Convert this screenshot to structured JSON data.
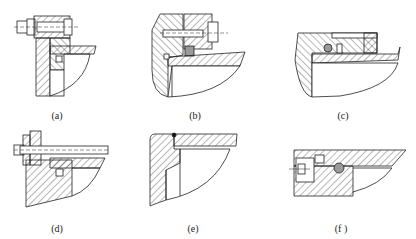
{
  "figure": {
    "top_cut_text": "— — — — — — — — — — — — — — — — — — —",
    "panels": [
      {
        "id": "a",
        "label": "(a)",
        "description": "Bolted flange with seal ring in groove"
      },
      {
        "id": "b",
        "label": "(b)",
        "description": "Bolted cover with square seal and O-ring"
      },
      {
        "id": "c",
        "label": "(c)",
        "description": "O-ring in groove with backup ring"
      },
      {
        "id": "d",
        "label": "(d)",
        "description": "Through-bolt flange with seal ring"
      },
      {
        "id": "e",
        "label": "(e)",
        "description": "Welded joint"
      },
      {
        "id": "f",
        "label": "(f )",
        "description": "Screw-retained plug with O-ring"
      }
    ]
  },
  "colors": {
    "line": "#222222",
    "hatch": "#333333",
    "seal_fill": "#9a9a9a",
    "background": "#ffffff"
  }
}
